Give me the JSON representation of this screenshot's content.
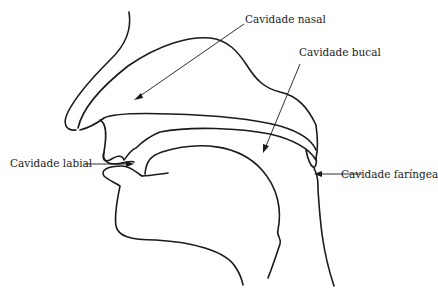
{
  "diagram": {
    "type": "anatomical-sagittal-section",
    "labels": {
      "nasal": "Cavidade nasal",
      "bucal": "Cavidade bucal",
      "labial": "Cavidade labial",
      "faringea": "Cavidade faríngea"
    },
    "colors": {
      "line": "#1a1a1a",
      "background": "#ffffff"
    }
  }
}
